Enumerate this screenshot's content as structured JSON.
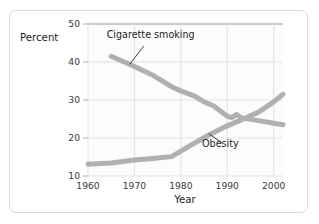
{
  "figure": {
    "background_color": "#ffffff",
    "border_color": "#dcdcdc",
    "plot_background_color": "#fcfcfc"
  },
  "labels": {
    "percent_axis_title": "Percent",
    "year_axis_title": "Year",
    "annotation_smoking": "Cigarette smoking",
    "annotation_obesity": "Obesity"
  },
  "ticks": {
    "y": [
      "10",
      "20",
      "30",
      "40",
      "50"
    ],
    "x": [
      "1960",
      "1970",
      "1980",
      "1990",
      "2000"
    ]
  },
  "chart_data": {
    "type": "line",
    "title": "",
    "subtitle": "",
    "xlabel": "Year",
    "ylabel": "Percent",
    "xlim": [
      1960,
      2002
    ],
    "ylim": [
      10,
      50
    ],
    "xticks": [
      1960,
      1970,
      1980,
      1990,
      2000
    ],
    "yticks": [
      10,
      20,
      30,
      40,
      50
    ],
    "grid": true,
    "legend_position": "inline-annotations",
    "line_color": "#b0b0b0",
    "line_width_px": 5,
    "series": [
      {
        "name": "Cigarette smoking",
        "annotation": "Cigarette smoking",
        "color": "#b0b0b0",
        "points": [
          [
            1965,
            41.5
          ],
          [
            1970,
            38.8
          ],
          [
            1974,
            36.5
          ],
          [
            1978,
            33.5
          ],
          [
            1980,
            32.4
          ],
          [
            1983,
            31.0
          ],
          [
            1985,
            29.5
          ],
          [
            1987,
            28.5
          ],
          [
            1990,
            25.7
          ],
          [
            1991,
            25.4
          ],
          [
            1992,
            26.2
          ],
          [
            1993,
            25.3
          ],
          [
            1995,
            24.9
          ],
          [
            1997,
            24.5
          ],
          [
            2000,
            23.9
          ],
          [
            2002,
            23.5
          ]
        ]
      },
      {
        "name": "Obesity",
        "annotation": "Obesity",
        "color": "#b0b0b0",
        "points": [
          [
            1960,
            13.1
          ],
          [
            1965,
            13.4
          ],
          [
            1970,
            14.2
          ],
          [
            1974,
            14.6
          ],
          [
            1978,
            15.1
          ],
          [
            1982,
            18.0
          ],
          [
            1986,
            20.8
          ],
          [
            1990,
            23.2
          ],
          [
            1994,
            25.3
          ],
          [
            1997,
            27.0
          ],
          [
            2000,
            29.5
          ],
          [
            2002,
            31.5
          ]
        ]
      }
    ],
    "annotations": [
      {
        "text": "Cigarette smoking",
        "text_x": 1973.5,
        "text_y": 46.2,
        "leader_from": [
          1972.0,
          44.2
        ],
        "leader_to": [
          1969.0,
          39.4
        ]
      },
      {
        "text": "Obesity",
        "text_x": 1988.5,
        "text_y": 17.6,
        "leader_from": [
          1988.8,
          18.8
        ],
        "leader_to": [
          1986.0,
          21.1
        ]
      }
    ]
  }
}
